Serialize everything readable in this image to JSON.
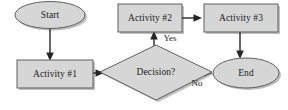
{
  "diagram": {
    "type": "flowchart",
    "colors": {
      "shape_fill": "#d6d6d6",
      "shape_border": "#5f5f5f",
      "connector": "#262626",
      "text": "#1c1c1c",
      "background": "#ffffff",
      "shadow": "#a8a8a8"
    },
    "nodes": [
      {
        "id": "start",
        "label": "Start",
        "shape": "ellipse"
      },
      {
        "id": "activity1",
        "label": "Activity #1",
        "shape": "rectangle"
      },
      {
        "id": "decision",
        "label": "Decision?",
        "shape": "diamond"
      },
      {
        "id": "activity2",
        "label": "Activity #2",
        "shape": "rectangle"
      },
      {
        "id": "activity3",
        "label": "Activity #3",
        "shape": "rectangle"
      },
      {
        "id": "end",
        "label": "End",
        "shape": "ellipse"
      }
    ],
    "edges": [
      {
        "id": "start-to-activity1",
        "from": "start",
        "to": "activity1",
        "label": ""
      },
      {
        "id": "activity1-to-decision",
        "from": "activity1",
        "to": "decision",
        "label": ""
      },
      {
        "id": "decision-to-activity2",
        "from": "decision",
        "to": "activity2",
        "label": "Yes"
      },
      {
        "id": "activity2-to-activity3",
        "from": "activity2",
        "to": "activity3",
        "label": ""
      },
      {
        "id": "activity3-to-end",
        "from": "activity3",
        "to": "end",
        "label": ""
      },
      {
        "id": "decision-to-end",
        "from": "decision",
        "to": "end",
        "label": "No"
      }
    ]
  }
}
